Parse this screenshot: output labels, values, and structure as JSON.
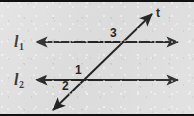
{
  "figure": {
    "width": 194,
    "height": 116,
    "background_color": "#dcdcdc",
    "ink_color": "#101010",
    "border_color": "#111111"
  },
  "labels": {
    "line1": {
      "text": "l",
      "subscript": "1",
      "x": 14,
      "y": 34
    },
    "line2": {
      "text": "l",
      "subscript": "2",
      "x": 14,
      "y": 72
    },
    "transversal": {
      "text": "t",
      "x": 156,
      "y": 7
    }
  },
  "angles": [
    {
      "name": "angle-1",
      "text": "1",
      "x": 75,
      "y": 64
    },
    {
      "name": "angle-2",
      "text": "2",
      "x": 62,
      "y": 80
    },
    {
      "name": "angle-3",
      "text": "3",
      "x": 110,
      "y": 27
    }
  ],
  "geometry": {
    "line1": {
      "x1": 36,
      "y1": 42,
      "x2": 178,
      "y2": 42
    },
    "line2": {
      "x1": 36,
      "y1": 80,
      "x2": 178,
      "y2": 80
    },
    "transversal": {
      "x1": 53,
      "y1": 110,
      "x2": 152,
      "y2": 14
    },
    "stroke_width": 1.8,
    "arrow_size": 7
  }
}
